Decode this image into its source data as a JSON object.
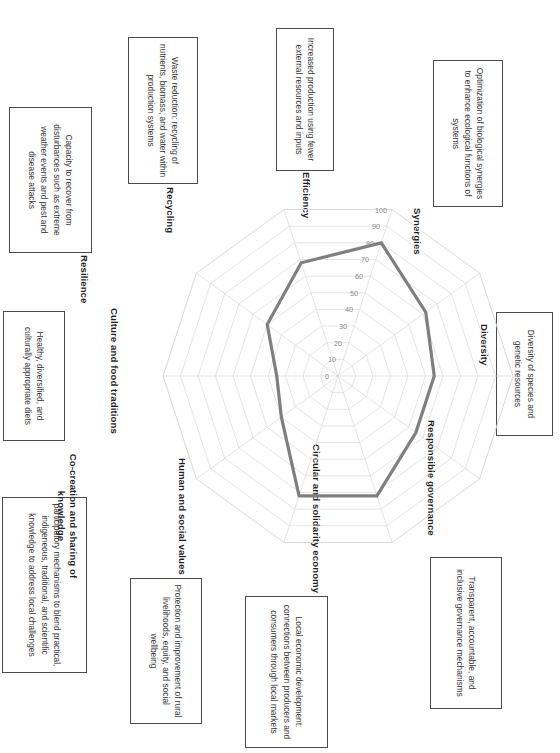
{
  "chart_data": {
    "type": "radar",
    "title": "",
    "categories": [
      "Efficiency",
      "Recycling",
      "Resilience",
      "Culture and food traditions",
      "Co-creation and sharing of knowledge",
      "Human and social values",
      "Circular and solidarity economy",
      "Responsible governance",
      "Diversity",
      "Synergies"
    ],
    "values": [
      55,
      55,
      72,
      72,
      40,
      35,
      50,
      68,
      80,
      62
    ],
    "series": [
      {
        "name": "Assessment score",
        "values": [
          55,
          55,
          72,
          72,
          40,
          35,
          50,
          68,
          80,
          62
        ],
        "color": "#7f7f7f"
      }
    ],
    "tick_labels": [
      "0",
      "10",
      "20",
      "30",
      "40",
      "50",
      "60",
      "70",
      "80",
      "90",
      "100"
    ],
    "rlim": [
      0,
      100
    ],
    "rstep": 10,
    "grid": true,
    "legend": "none",
    "gridline_color": "#d9d9d9",
    "series_color": "#7f7f7f"
  },
  "axes": [
    {
      "id": "efficiency",
      "label": "Efficiency",
      "description": "Increased production using fewer external resources and inputs"
    },
    {
      "id": "recycling",
      "label": "Recycling",
      "description": "Waste reduction: recycling of nutrients, biomass, and water within production systems"
    },
    {
      "id": "resilience",
      "label": "Resilience",
      "description": "Capacity to recover from disturbances such as extreme weather events and pest and disease attacks"
    },
    {
      "id": "culture-and-food-traditions",
      "label": "Culture and food traditions",
      "description": "Healthy, diversified, and culturally appropriate diets"
    },
    {
      "id": "co-creation-and-sharing-of-knowledge",
      "label": "Co-creation and sharing of knowledge",
      "description": "participatory mechanisms to blend practical, indigeneous, traditional, and scientific knowledge to address local challenges"
    },
    {
      "id": "human-and-social-values",
      "label": "Human and social values",
      "description": "Protection and improvement of rural livelihoods, equity, and social wellbeing"
    },
    {
      "id": "circular-and-solidarity-economy",
      "label": "Circular and solidarity economy",
      "description": "Local economic development: connections between producers and consumers through local markets"
    },
    {
      "id": "responsible-governance",
      "label": "Responsible governance",
      "description": "Transparent, accountable, and inclusive governance mechanisms"
    },
    {
      "id": "diversity",
      "label": "Diversity",
      "description": "Diversity of species and genetic resources"
    },
    {
      "id": "synergies",
      "label": "Synergies",
      "description": "Optimization of biological synergies to enhance ecological functions of systems"
    }
  ]
}
